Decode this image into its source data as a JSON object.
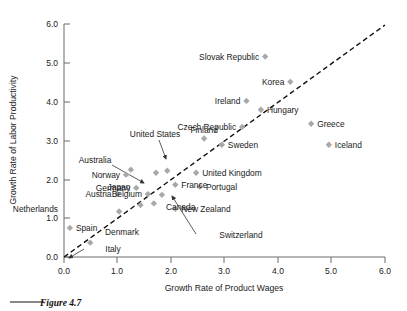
{
  "figure": {
    "caption": "Figure 4.7"
  },
  "chart_data": {
    "type": "scatter",
    "title": "",
    "xlabel": "Growth Rate of Product Wages",
    "ylabel": "Growth Rate of Labor Productivity",
    "xlim": [
      0.0,
      6.0
    ],
    "ylim": [
      0.0,
      6.0
    ],
    "xticks": [
      "0.0",
      "1.0",
      "2.0",
      "3.0",
      "4.0",
      "5.0",
      "6.0"
    ],
    "yticks": [
      "0.0",
      "1.0",
      "2.0",
      "3.0",
      "4.0",
      "5.0",
      "6.0"
    ],
    "grid": false,
    "legend": "none",
    "reference_line": {
      "name": "45-degree-line",
      "style": "dashed",
      "from": [
        0.0,
        0.0
      ],
      "to": [
        6.0,
        6.0
      ]
    },
    "points": [
      {
        "label": "Slovak Republic",
        "x": 3.76,
        "y": 5.16,
        "label_side": "left"
      },
      {
        "label": "Korea",
        "x": 4.23,
        "y": 4.51,
        "label_side": "left"
      },
      {
        "label": "Ireland",
        "x": 3.41,
        "y": 4.02,
        "label_side": "left"
      },
      {
        "label": "Hungary",
        "x": 3.68,
        "y": 3.79,
        "label_side": "right"
      },
      {
        "label": "Greece",
        "x": 4.62,
        "y": 3.43,
        "label_side": "right"
      },
      {
        "label": "Iceland",
        "x": 4.95,
        "y": 2.89,
        "label_side": "right"
      },
      {
        "label": "Czech Republic",
        "x": 3.33,
        "y": 3.35,
        "label_side": "left"
      },
      {
        "label": "Sweden",
        "x": 2.95,
        "y": 2.89,
        "label_side": "right"
      },
      {
        "label": "Finland",
        "x": 2.62,
        "y": 3.05,
        "label_side": "above"
      },
      {
        "label": "United Kingdom",
        "x": 2.47,
        "y": 2.17,
        "label_side": "right"
      },
      {
        "label": "Portugal",
        "x": 2.54,
        "y": 1.81,
        "label_side": "right"
      },
      {
        "label": "France",
        "x": 2.08,
        "y": 1.86,
        "label_side": "right"
      },
      {
        "label": "New Zealand",
        "x": 2.08,
        "y": 1.24,
        "label_side": "right"
      },
      {
        "label": "Canada",
        "x": 1.83,
        "y": 1.6,
        "label_side": "right"
      },
      {
        "label": "Japan",
        "x": 1.72,
        "y": 2.17,
        "label_side": "leader"
      },
      {
        "label": "United States",
        "x": 1.93,
        "y": 2.22,
        "label_side": "leader"
      },
      {
        "label": "Australia",
        "x": 1.25,
        "y": 2.25,
        "label_side": "leader"
      },
      {
        "label": "Norway",
        "x": 1.16,
        "y": 2.12,
        "label_side": "left"
      },
      {
        "label": "Germany",
        "x": 1.35,
        "y": 1.78,
        "label_side": "left"
      },
      {
        "label": "Austria",
        "x": 1.0,
        "y": 1.62,
        "label_side": "left"
      },
      {
        "label": "Belgium",
        "x": 1.57,
        "y": 1.62,
        "label_side": "left"
      },
      {
        "label": "Netherlands",
        "x": 1.03,
        "y": 1.17,
        "label_side": "left"
      },
      {
        "label": "Denmark",
        "x": 1.43,
        "y": 1.34,
        "label_side": "below"
      },
      {
        "label": "Switzerland",
        "x": 1.68,
        "y": 1.38,
        "label_side": "leader"
      },
      {
        "label": "Spain",
        "x": 0.11,
        "y": 0.75,
        "label_side": "right"
      },
      {
        "label": "Italy",
        "x": 0.49,
        "y": 0.37,
        "label_side": "below"
      }
    ]
  }
}
